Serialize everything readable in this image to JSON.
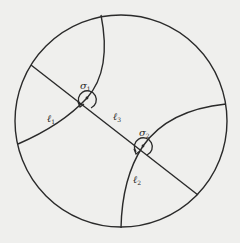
{
  "diagram": {
    "background": "#efefed",
    "stroke": "#2a2a2a",
    "boundary_circle": {
      "cx": 121,
      "cy": 121,
      "r": 106
    },
    "vertices": [
      {
        "id": "sigma1",
        "symbol": "σ",
        "subscript": "1",
        "x": 87,
        "y": 98
      },
      {
        "id": "sigma2",
        "symbol": "σ",
        "subscript": "2",
        "x": 143,
        "y": 146
      }
    ],
    "edges": [
      {
        "id": "l1",
        "symbol": "ℓ",
        "subscript": "1"
      },
      {
        "id": "l2",
        "symbol": "ℓ",
        "subscript": "2"
      },
      {
        "id": "l3",
        "symbol": "ℓ",
        "subscript": "3"
      }
    ],
    "labels": {
      "sigma1": {
        "main": "σ",
        "sub": "1"
      },
      "sigma2": {
        "main": "σ",
        "sub": "2"
      },
      "l1": {
        "main": "ℓ",
        "sub": "1"
      },
      "l2": {
        "main": "ℓ",
        "sub": "2"
      },
      "l3": {
        "main": "ℓ",
        "sub": "3"
      }
    }
  }
}
